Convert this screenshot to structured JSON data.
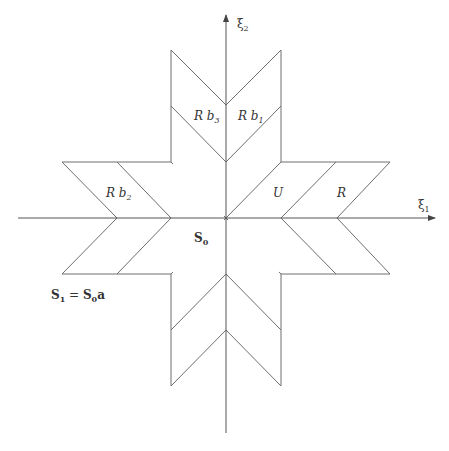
{
  "figure": {
    "type": "geometric-diagram",
    "stroke_color": "#6e6e6e",
    "text_color": "#333333",
    "background": "#ffffff"
  },
  "axes": {
    "x_label": "ξ",
    "x_label_sub": "1",
    "y_label": "ξ",
    "y_label_sub": "2"
  },
  "regions": {
    "rb1": {
      "base": "R b",
      "sub": "1"
    },
    "rb2": {
      "base": "R b",
      "sub": "2"
    },
    "rb3": {
      "base": "R b",
      "sub": "3"
    },
    "u": {
      "label": "U"
    },
    "r": {
      "label": "R"
    },
    "s0": {
      "base": "S",
      "sub": "0"
    }
  },
  "caption": {
    "lhs_base": "S",
    "lhs_sub": "1",
    "eq": " = ",
    "rhs_base": "S",
    "rhs_sub": "0",
    "rhs_tail": "a"
  }
}
